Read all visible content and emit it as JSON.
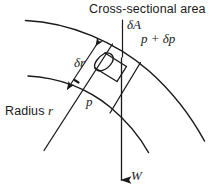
{
  "figure": {
    "type": "physics-schematic",
    "background_color": "#ffffff",
    "stroke_color": "#1a1a1a",
    "width": 213,
    "height": 192,
    "labels": {
      "cross_sectional_area": "Cross-sectional area",
      "delta_a": "δA",
      "pressure_upper": "p + δp",
      "pressure_upper_parts": {
        "p": "p",
        "operator": "+",
        "delta_p": "δp"
      },
      "delta_r": "δr",
      "pressure_lower": "p",
      "radius_r": "Radius r",
      "radius_r_parts": {
        "word": "Radius",
        "symbol": "r"
      },
      "weight": "W"
    },
    "annotations": {
      "leader_delta_a": "vertical leader line from δA label down to element top face",
      "arrow_delta_r": "double-headed arrow spanning radial thickness between the two arcs",
      "arrow_weight": "downward arrow labelled W indicating weight of element",
      "arcs": "two concentric circular arcs representing radii r and r + δr",
      "radial_lines": "two radial straight lines bounding the fluid element",
      "element": "small cylindrical element of cross-sectional area δA and radial length δr"
    }
  }
}
